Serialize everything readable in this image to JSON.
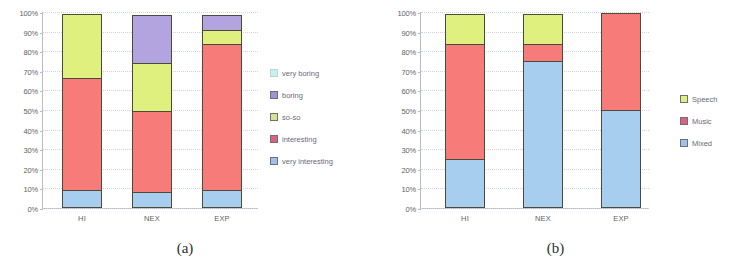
{
  "figure": {
    "subfigures": [
      {
        "caption": "(a)",
        "yaxis": {
          "ticks": [
            "100%",
            "90%",
            "80%",
            "70%",
            "60%",
            "50%",
            "40%",
            "30%",
            "20%",
            "10%",
            "0%"
          ],
          "min": 0,
          "max": 100
        },
        "legend": {
          "position": "right",
          "items": [
            {
              "label": "very boring",
              "color": "#c9f0ef"
            },
            {
              "label": "boring",
              "color": "#a094d8"
            },
            {
              "label": "so-so",
              "color": "#d5e68a"
            },
            {
              "label": "interesting",
              "color": "#e0607a"
            },
            {
              "label": "very interesting",
              "color": "#9fc2e8"
            }
          ]
        },
        "chart_data": {
          "type": "bar",
          "stacked": true,
          "normalized": true,
          "title": "",
          "xlabel": "",
          "ylabel": "",
          "ylim": [
            0,
            100
          ],
          "grid": true,
          "categories": [
            "HI",
            "NEX",
            "EXP"
          ],
          "series": [
            {
              "name": "very interesting",
              "color": "#a7cdef",
              "values": [
                9,
                8,
                9
              ]
            },
            {
              "name": "interesting",
              "color": "#f77b78",
              "values": [
                58,
                42,
                75
              ]
            },
            {
              "name": "so-so",
              "color": "#dff07e",
              "values": [
                33,
                25,
                8
              ]
            },
            {
              "name": "boring",
              "color": "#b3a4e0",
              "values": [
                0,
                25,
                8
              ]
            },
            {
              "name": "very boring",
              "color": "#c9f0ef",
              "values": [
                0,
                0,
                0
              ]
            }
          ]
        }
      },
      {
        "caption": "(b)",
        "yaxis": {
          "ticks": [
            "100%",
            "90%",
            "80%",
            "70%",
            "60%",
            "50%",
            "40%",
            "30%",
            "20%",
            "10%",
            "0%"
          ],
          "min": 0,
          "max": 100
        },
        "legend": {
          "position": "right",
          "items": [
            {
              "label": "Speech",
              "color": "#dff07e"
            },
            {
              "label": "Music",
              "color": "#e0607a"
            },
            {
              "label": "Mixed",
              "color": "#9fc2e8"
            }
          ]
        },
        "chart_data": {
          "type": "bar",
          "stacked": true,
          "normalized": true,
          "title": "",
          "xlabel": "",
          "ylabel": "",
          "ylim": [
            0,
            100
          ],
          "grid": true,
          "categories": [
            "HI",
            "NEX",
            "EXP"
          ],
          "series": [
            {
              "name": "Mixed",
              "color": "#a7cdef",
              "values": [
                25,
                75,
                50
              ]
            },
            {
              "name": "Music",
              "color": "#f77b78",
              "values": [
                59,
                9,
                50
              ]
            },
            {
              "name": "Speech",
              "color": "#dff07e",
              "values": [
                16,
                16,
                0
              ]
            }
          ]
        }
      }
    ]
  }
}
